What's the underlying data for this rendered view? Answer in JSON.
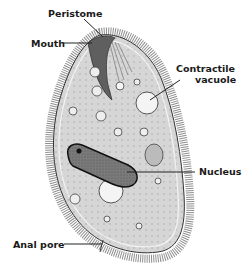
{
  "diagram": {
    "labels": {
      "peristome": "Peristome",
      "mouth": "Mouth",
      "contractile_vacuole_line1": "Contractile",
      "contractile_vacuole_line2": "vacuole",
      "nucleus": "Nucleus",
      "anal_pore": "Anal pore"
    },
    "colors": {
      "cilia": "#8a8a8a",
      "cytoplasm": "#d4d4d4",
      "outline": "#222222",
      "nucleus": "#777777",
      "vacuole": "#f4f4f4"
    }
  }
}
